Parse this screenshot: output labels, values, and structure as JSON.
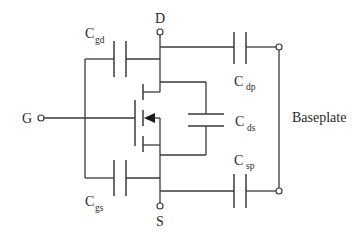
{
  "diagram": {
    "terminals": {
      "drain": "D",
      "gate": "G",
      "source": "S",
      "baseplate": "Baseplate"
    },
    "capacitors": {
      "cgd": {
        "main": "C",
        "sub": "gd"
      },
      "cgs": {
        "main": "C",
        "sub": "gs"
      },
      "cds": {
        "main": "C",
        "sub": "ds"
      },
      "cdp": {
        "main": "C",
        "sub": "dp"
      },
      "csp": {
        "main": "C",
        "sub": "sp"
      }
    },
    "colors": {
      "line": "#3a3a3a",
      "text": "#2a2a2a",
      "background": "#ffffff"
    }
  }
}
